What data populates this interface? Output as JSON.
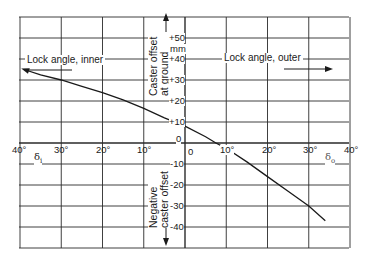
{
  "chart_data": {
    "type": "line",
    "title": "",
    "xlabel_left": "δi",
    "xlabel_right": "δo",
    "ylabel_top": "Caster offset at ground",
    "ylabel_top_unit": "mm",
    "ylabel_bottom": "Negative caster offset",
    "annotations": [
      {
        "text": "Lock angle, inner",
        "arrow": "left"
      },
      {
        "text": "Lock angle, outer",
        "arrow": "right"
      }
    ],
    "x_tick_labels": [
      "40°",
      "30°",
      "20°",
      "10°",
      "0",
      "10°",
      "20°",
      "30°",
      "40°"
    ],
    "x_ticks_signed": [
      -40,
      -30,
      -20,
      -10,
      0,
      10,
      20,
      30,
      40
    ],
    "y_tick_labels": [
      "+50",
      "+40",
      "+30",
      "+20",
      "+10",
      "0",
      "-10",
      "-20",
      "-30",
      "-40"
    ],
    "y_ticks": [
      50,
      40,
      30,
      20,
      10,
      0,
      -10,
      -20,
      -30,
      -40
    ],
    "xlim": [
      -40,
      40
    ],
    "ylim": [
      -50,
      60
    ],
    "grid": true,
    "series": [
      {
        "name": "Caster offset vs lock angle",
        "x": [
          -39,
          -35,
          -30,
          -25,
          -20,
          -15,
          -10,
          -5,
          0,
          5,
          7.5,
          10,
          15,
          20,
          25,
          30,
          34
        ],
        "y": [
          35,
          32.5,
          30,
          27,
          24,
          20.5,
          16.5,
          12,
          8,
          3,
          0,
          -2.5,
          -9,
          -16,
          -23,
          -30,
          -37
        ]
      }
    ]
  },
  "labels": {
    "lock_inner": "Lock angle, inner",
    "lock_outer": "Lock angle, outer",
    "caster_line1": "Caster offset",
    "caster_line2": "at ground",
    "unit": "mm",
    "neg_line1": "Negative",
    "neg_line2": "caster offset",
    "delta_i": "δ",
    "delta_i_sub": "i",
    "delta_o": "δ",
    "delta_o_sub": "o"
  },
  "ticks": {
    "x": [
      "40°",
      "30°",
      "20°",
      "10°",
      "0",
      "10°",
      "20°",
      "30°",
      "40°"
    ],
    "y": [
      "+50",
      "+40",
      "+30",
      "+20",
      "+10",
      "0",
      "-10",
      "-20",
      "-30",
      "-40"
    ]
  },
  "colors": {
    "ink": "#1a1a1a",
    "grid": "#2a2a2a",
    "background": "#ffffff"
  }
}
